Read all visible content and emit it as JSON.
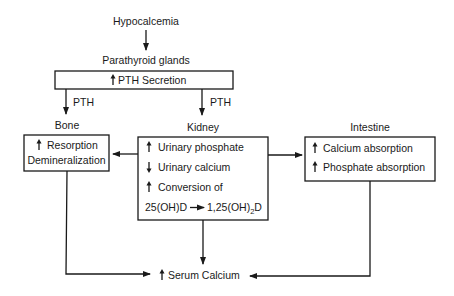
{
  "diagram": {
    "title_node": "Hypocalcemia",
    "gland_label": "Parathyroid glands",
    "pth_box": {
      "arrow": "up",
      "label": "PTH Secretion"
    },
    "edge_labels": {
      "left": "PTH",
      "right": "PTH"
    },
    "bone": {
      "header": "Bone",
      "lines": [
        {
          "arrow": "up",
          "text": "Resorption"
        },
        {
          "arrow": "",
          "text": "Demineralization"
        }
      ]
    },
    "kidney": {
      "header": "Kidney",
      "lines": [
        {
          "arrow": "up",
          "text": "Urinary phosphate"
        },
        {
          "arrow": "down",
          "text": "Urinary calcium"
        },
        {
          "arrow": "up",
          "text": "Conversion of"
        }
      ],
      "conversion": {
        "from": "25(OH)D",
        "to_prefix": "1,25(OH)",
        "to_sub": "2",
        "to_suffix": "D"
      }
    },
    "intestine": {
      "header": "Intestine",
      "lines": [
        {
          "arrow": "up",
          "text": "Calcium absorption"
        },
        {
          "arrow": "up",
          "text": "Phosphate absorption"
        }
      ]
    },
    "outcome": {
      "arrow": "up",
      "text": "Serum Calcium"
    },
    "colors": {
      "ink": "#1a1a1a",
      "background": "#ffffff"
    }
  }
}
